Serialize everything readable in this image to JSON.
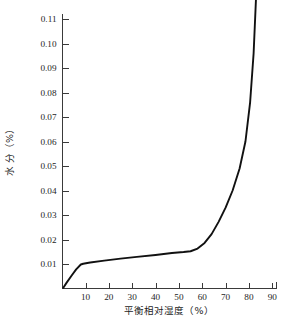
{
  "chart_data": {
    "type": "line",
    "title": "",
    "xlabel": "平衡相对湿度（%）",
    "ylabel": "水 分（%）",
    "xlim": [
      0,
      92
    ],
    "ylim": [
      0,
      0.125
    ],
    "grid": false,
    "legend": null,
    "xticks": [
      "10",
      "20",
      "30",
      "40",
      "50",
      "60",
      "70",
      "80",
      "90"
    ],
    "xtick_values": [
      10,
      20,
      30,
      40,
      50,
      60,
      70,
      80,
      90
    ],
    "yticks": [
      "0.01",
      "0.02",
      "0.03",
      "0.04",
      "0.05",
      "0.06",
      "0.07",
      "0.08",
      "0.09",
      "0.10",
      "0.11",
      "0.12"
    ],
    "ytick_values": [
      0.01,
      0.02,
      0.03,
      0.04,
      0.05,
      0.06,
      0.07,
      0.08,
      0.09,
      0.1,
      0.11,
      0.12
    ],
    "series": [
      {
        "name": "吸湿等温线",
        "color": "#111111",
        "x": [
          0.5,
          2.0,
          4.0,
          6.0,
          8.0,
          9.0,
          12.0,
          18.0,
          25.0,
          32.0,
          40.0,
          47.0,
          52.0,
          55.0,
          58.0,
          61.0,
          64.0,
          67.0,
          70.0,
          73.0,
          76.0,
          78.5,
          80.5,
          82.0,
          83.0
        ],
        "y": [
          0.0003,
          0.0025,
          0.0052,
          0.0078,
          0.0098,
          0.0101,
          0.0106,
          0.0114,
          0.0122,
          0.0129,
          0.0137,
          0.0145,
          0.0149,
          0.0152,
          0.0163,
          0.0186,
          0.0222,
          0.0272,
          0.033,
          0.04,
          0.049,
          0.06,
          0.076,
          0.096,
          0.118
        ]
      }
    ]
  },
  "axes": {
    "x_axis_label": "平衡相对湿度（%）",
    "y_axis_label": "水 分（%）"
  },
  "caption": {
    "text": ""
  }
}
